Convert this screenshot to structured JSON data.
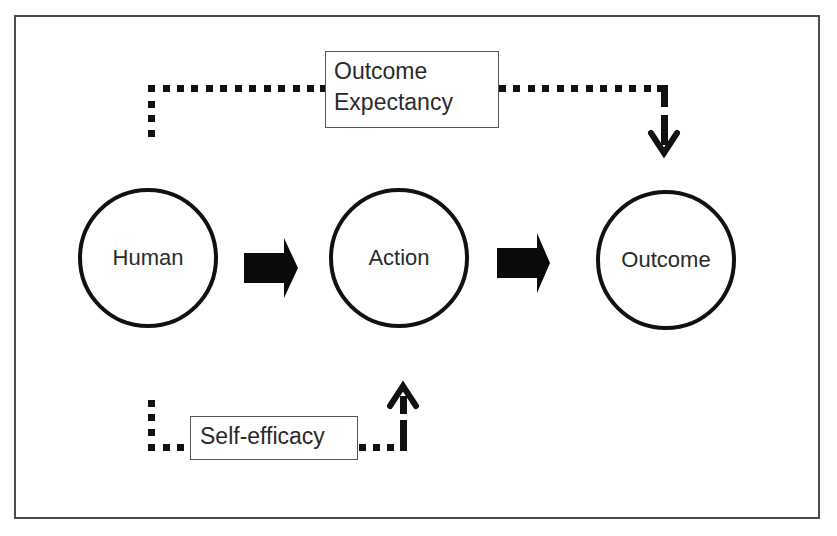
{
  "diagram": {
    "nodes": [
      {
        "id": "human",
        "label": "Human"
      },
      {
        "id": "action",
        "label": "Action"
      },
      {
        "id": "outcome",
        "label": "Outcome"
      }
    ],
    "edges": [
      {
        "from": "human",
        "to": "action",
        "style": "solid-block-arrow"
      },
      {
        "from": "action",
        "to": "outcome",
        "style": "solid-block-arrow"
      },
      {
        "from": "human",
        "to": "outcome",
        "style": "dotted-arrow",
        "label": "Outcome Expectancy"
      },
      {
        "from": "human",
        "to": "action",
        "style": "dotted-arrow",
        "label": "Self-efficacy"
      }
    ],
    "labels": {
      "outcome_expectancy_line1": "Outcome",
      "outcome_expectancy_line2": "Expectancy",
      "self_efficacy": "Self-efficacy"
    },
    "colors": {
      "stroke": "#111111",
      "frame": "#4a4a4a",
      "text": "#2a2a2a",
      "background": "#ffffff"
    }
  }
}
